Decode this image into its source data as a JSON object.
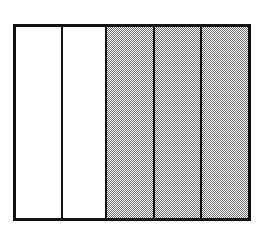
{
  "figure": {
    "kind": "panel-bar-diagram",
    "background_color": "#ffffff",
    "box": {
      "left": 13,
      "top": 24,
      "width": 238,
      "height": 197,
      "border_width": 3,
      "border_color": "#121212"
    },
    "divider": {
      "width": 2,
      "color": "#121212"
    },
    "fill_colors": {
      "empty": "#ffffff",
      "shaded": "#6e6e6e",
      "shaded_apparent": "#b4b4b4"
    },
    "panels": [
      {
        "index": 1,
        "label": "",
        "fill": "empty",
        "width_px": 45,
        "divider_left": false
      },
      {
        "index": 2,
        "label": "",
        "fill": "empty",
        "width_px": 44,
        "divider_left": true
      },
      {
        "index": 3,
        "label": "",
        "fill": "shaded",
        "width_px": 48,
        "divider_left": true
      },
      {
        "index": 4,
        "label": "",
        "fill": "shaded",
        "width_px": 47,
        "divider_left": true
      },
      {
        "index": 5,
        "label": "",
        "fill": "shaded",
        "width_px": 48,
        "divider_left": true
      }
    ]
  },
  "chart_data": {
    "type": "bar",
    "title": "",
    "subtitle": "",
    "xlabel": "",
    "ylabel": "",
    "grid": false,
    "legend": null,
    "categories": [
      "1",
      "2",
      "3",
      "4",
      "5"
    ],
    "values": [
      1,
      1,
      1,
      1,
      1
    ],
    "ylim": [
      0,
      1
    ],
    "series": [
      {
        "name": "panel fill",
        "values": [
          "empty",
          "empty",
          "shaded",
          "shaded",
          "shaded"
        ]
      }
    ],
    "annotations": []
  }
}
